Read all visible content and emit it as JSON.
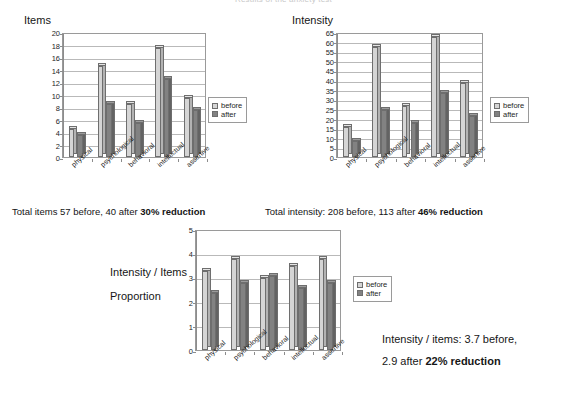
{
  "page": {
    "title": "Results of the anxiety test"
  },
  "categories": [
    "physical",
    "psychological",
    "behavioral",
    "intellectual",
    "assertive"
  ],
  "legend": {
    "before": "before",
    "after": "after"
  },
  "charts": {
    "items": {
      "title": "Items",
      "summary_prefix": "Total items  57 before,  40 after",
      "summary_bold": "30% reduction"
    },
    "intensity": {
      "title": "Intensity",
      "summary_prefix": "Total intensity:  208 before,  113 after",
      "summary_bold": "46% reduction"
    },
    "proportion": {
      "title_line1": "Intensity / Items",
      "title_line2": "Proportion",
      "note_line1": "Intensity / items: 3.7 before,",
      "note_line2_prefix": "2.9 after",
      "note_line2_bold": "22% reduction"
    }
  },
  "colors": {
    "before": "#d5d5d5",
    "after": "#828282",
    "grid": "#b9b9b9",
    "axis": "#8c8c8c",
    "text": "#141414"
  },
  "chart_data": [
    {
      "type": "bar",
      "id": "items",
      "title": "Items",
      "xlabel": "",
      "ylabel": "",
      "ylim": [
        0,
        20
      ],
      "yticks": [
        0,
        2,
        4,
        6,
        8,
        10,
        12,
        14,
        16,
        18,
        20
      ],
      "grid": true,
      "legend_position": "right",
      "categories": [
        "physical",
        "psychological",
        "behavioral",
        "intellectual",
        "assertive"
      ],
      "series": [
        {
          "name": "before",
          "values": [
            5,
            15,
            9,
            18,
            10
          ]
        },
        {
          "name": "after",
          "values": [
            4,
            9,
            6,
            13,
            8
          ]
        }
      ],
      "totals": {
        "before": 57,
        "after": 40,
        "reduction_pct": 30
      }
    },
    {
      "type": "bar",
      "id": "intensity",
      "title": "Intensity",
      "xlabel": "",
      "ylabel": "",
      "ylim": [
        0,
        65
      ],
      "yticks": [
        0,
        5,
        10,
        15,
        20,
        25,
        30,
        35,
        40,
        45,
        50,
        55,
        60,
        65
      ],
      "grid": true,
      "legend_position": "right",
      "categories": [
        "physical",
        "psychological",
        "behavioral",
        "intellectual",
        "assertive"
      ],
      "series": [
        {
          "name": "before",
          "values": [
            17,
            59,
            28,
            64,
            40
          ]
        },
        {
          "name": "after",
          "values": [
            10,
            26,
            19,
            35,
            23
          ]
        }
      ],
      "totals": {
        "before": 208,
        "after": 113,
        "reduction_pct": 46
      }
    },
    {
      "type": "bar",
      "id": "proportion",
      "title": "Intensity / Items Proportion",
      "xlabel": "",
      "ylabel": "",
      "ylim": [
        0,
        5
      ],
      "yticks": [
        0,
        1,
        2,
        3,
        4,
        5
      ],
      "grid": true,
      "legend_position": "right",
      "categories": [
        "physical",
        "psychological",
        "behavioral",
        "intellectual",
        "assertive"
      ],
      "series": [
        {
          "name": "before",
          "values": [
            3.4,
            3.9,
            3.1,
            3.6,
            3.9
          ]
        },
        {
          "name": "after",
          "values": [
            2.5,
            2.9,
            3.2,
            2.7,
            2.9
          ]
        }
      ],
      "totals": {
        "before": 3.7,
        "after": 2.9,
        "reduction_pct": 22
      }
    }
  ]
}
